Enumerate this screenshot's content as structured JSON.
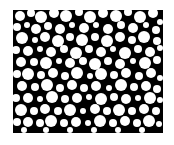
{
  "image": {
    "width": 174,
    "height": 145,
    "background": "#ffffff",
    "panel": {
      "x": 13,
      "y": 10,
      "width": 150,
      "height": 123,
      "color": "#000000"
    },
    "particle_color": "#ffffff",
    "description": "Binary micrograph of densely packed white circular particles on black background",
    "particles": [
      [
        20,
        16,
        5
      ],
      [
        31,
        13,
        4
      ],
      [
        41,
        17,
        6
      ],
      [
        54,
        13,
        5
      ],
      [
        66,
        16,
        6
      ],
      [
        79,
        12,
        4
      ],
      [
        90,
        17,
        6
      ],
      [
        103,
        13,
        5
      ],
      [
        116,
        16,
        6
      ],
      [
        128,
        12,
        4
      ],
      [
        140,
        17,
        6
      ],
      [
        153,
        13,
        5
      ],
      [
        160,
        22,
        3
      ],
      [
        17,
        27,
        4
      ],
      [
        27,
        25,
        3
      ],
      [
        36,
        29,
        5
      ],
      [
        48,
        26,
        4
      ],
      [
        60,
        29,
        5
      ],
      [
        72,
        25,
        3
      ],
      [
        84,
        28,
        5
      ],
      [
        96,
        25,
        3
      ],
      [
        108,
        29,
        5
      ],
      [
        121,
        25,
        4
      ],
      [
        133,
        28,
        5
      ],
      [
        146,
        25,
        3
      ],
      [
        156,
        30,
        4
      ],
      [
        22,
        38,
        6
      ],
      [
        35,
        40,
        3
      ],
      [
        45,
        37,
        5
      ],
      [
        58,
        41,
        6
      ],
      [
        70,
        37,
        4
      ],
      [
        82,
        40,
        6
      ],
      [
        95,
        37,
        4
      ],
      [
        107,
        41,
        6
      ],
      [
        120,
        37,
        5
      ],
      [
        132,
        40,
        4
      ],
      [
        144,
        37,
        6
      ],
      [
        157,
        41,
        4
      ],
      [
        16,
        50,
        4
      ],
      [
        28,
        51,
        5
      ],
      [
        40,
        49,
        3
      ],
      [
        51,
        52,
        5
      ],
      [
        64,
        49,
        4
      ],
      [
        76,
        53,
        6
      ],
      [
        89,
        49,
        4
      ],
      [
        101,
        52,
        5
      ],
      [
        113,
        49,
        3
      ],
      [
        125,
        53,
        6
      ],
      [
        138,
        49,
        4
      ],
      [
        150,
        52,
        5
      ],
      [
        160,
        48,
        3
      ],
      [
        21,
        62,
        5
      ],
      [
        34,
        62,
        4
      ],
      [
        46,
        63,
        6
      ],
      [
        59,
        61,
        3
      ],
      [
        70,
        63,
        5
      ],
      [
        83,
        61,
        4
      ],
      [
        95,
        64,
        6
      ],
      [
        108,
        61,
        4
      ],
      [
        120,
        64,
        5
      ],
      [
        133,
        61,
        3
      ],
      [
        145,
        63,
        6
      ],
      [
        157,
        60,
        4
      ],
      [
        17,
        74,
        4
      ],
      [
        28,
        74,
        6
      ],
      [
        41,
        75,
        4
      ],
      [
        53,
        73,
        5
      ],
      [
        65,
        76,
        4
      ],
      [
        77,
        73,
        6
      ],
      [
        90,
        76,
        3
      ],
      [
        101,
        74,
        6
      ],
      [
        114,
        75,
        4
      ],
      [
        126,
        73,
        5
      ],
      [
        139,
        76,
        4
      ],
      [
        151,
        73,
        5
      ],
      [
        160,
        78,
        3
      ],
      [
        22,
        86,
        5
      ],
      [
        35,
        87,
        4
      ],
      [
        47,
        85,
        6
      ],
      [
        60,
        88,
        4
      ],
      [
        72,
        85,
        5
      ],
      [
        84,
        88,
        4
      ],
      [
        96,
        86,
        5
      ],
      [
        109,
        88,
        3
      ],
      [
        121,
        85,
        6
      ],
      [
        134,
        87,
        4
      ],
      [
        146,
        86,
        5
      ],
      [
        157,
        89,
        4
      ],
      [
        16,
        98,
        4
      ],
      [
        28,
        98,
        5
      ],
      [
        40,
        99,
        3
      ],
      [
        52,
        97,
        6
      ],
      [
        65,
        99,
        4
      ],
      [
        77,
        98,
        5
      ],
      [
        89,
        97,
        3
      ],
      [
        101,
        99,
        6
      ],
      [
        114,
        97,
        4
      ],
      [
        126,
        99,
        5
      ],
      [
        138,
        98,
        3
      ],
      [
        150,
        98,
        6
      ],
      [
        160,
        100,
        3
      ],
      [
        21,
        110,
        6
      ],
      [
        34,
        111,
        4
      ],
      [
        45,
        109,
        5
      ],
      [
        58,
        111,
        4
      ],
      [
        70,
        110,
        6
      ],
      [
        83,
        111,
        3
      ],
      [
        95,
        109,
        5
      ],
      [
        107,
        111,
        4
      ],
      [
        119,
        110,
        6
      ],
      [
        132,
        111,
        4
      ],
      [
        144,
        109,
        5
      ],
      [
        156,
        111,
        4
      ],
      [
        17,
        122,
        4
      ],
      [
        28,
        122,
        5
      ],
      [
        40,
        123,
        4
      ],
      [
        51,
        121,
        6
      ],
      [
        64,
        123,
        4
      ],
      [
        76,
        122,
        5
      ],
      [
        88,
        123,
        3
      ],
      [
        100,
        121,
        6
      ],
      [
        113,
        123,
        4
      ],
      [
        125,
        121,
        5
      ],
      [
        137,
        123,
        4
      ],
      [
        149,
        121,
        6
      ],
      [
        159,
        124,
        3
      ],
      [
        24,
        130,
        3
      ],
      [
        46,
        130,
        3
      ],
      [
        70,
        130,
        3
      ],
      [
        94,
        130,
        3
      ],
      [
        118,
        130,
        3
      ],
      [
        142,
        130,
        3
      ]
    ]
  }
}
